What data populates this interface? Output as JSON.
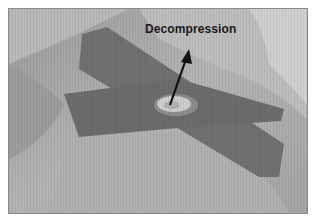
{
  "figure": {
    "annotation": {
      "label": "Decompression",
      "arrow": "arrow pointing from center of tape crossing up to label"
    },
    "colors": {
      "background": "#ffffff",
      "skin_light": "#c4c4c4",
      "skin_mid": "#a9a9a9",
      "skin_dark": "#8e8e8e",
      "tape": "#6f6f6f",
      "window": "#d2d2d2",
      "text": "#1a1a1a"
    }
  }
}
